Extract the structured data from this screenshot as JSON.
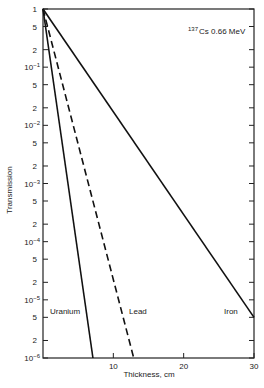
{
  "chart_data": {
    "type": "line",
    "title": "",
    "annotation": {
      "isotope_mass": "137",
      "text": "Cs 0.66 MeV"
    },
    "xlabel": "Thickness, cm",
    "ylabel": "Transmission",
    "xlim": [
      0,
      30
    ],
    "ylim": [
      1e-06,
      1
    ],
    "yscale": "log",
    "x_ticks": [
      {
        "value": 10,
        "label": "10"
      },
      {
        "value": 20,
        "label": "20"
      },
      {
        "value": 30,
        "label": "30"
      }
    ],
    "y_ticks": [
      {
        "value": 1,
        "label": "1",
        "exp": ""
      },
      {
        "value": 0.5,
        "label": "5",
        "exp": ""
      },
      {
        "value": 0.2,
        "label": "2",
        "exp": ""
      },
      {
        "value": 0.1,
        "label": "10",
        "exp": "−1"
      },
      {
        "value": 0.05,
        "label": "5",
        "exp": ""
      },
      {
        "value": 0.02,
        "label": "2",
        "exp": ""
      },
      {
        "value": 0.01,
        "label": "10",
        "exp": "−2"
      },
      {
        "value": 0.005,
        "label": "5",
        "exp": ""
      },
      {
        "value": 0.002,
        "label": "2",
        "exp": ""
      },
      {
        "value": 0.001,
        "label": "10",
        "exp": "−3"
      },
      {
        "value": 0.0005,
        "label": "5",
        "exp": ""
      },
      {
        "value": 0.0002,
        "label": "2",
        "exp": ""
      },
      {
        "value": 0.0001,
        "label": "10",
        "exp": "−4"
      },
      {
        "value": 5e-05,
        "label": "5",
        "exp": ""
      },
      {
        "value": 2e-05,
        "label": "2",
        "exp": ""
      },
      {
        "value": 1e-05,
        "label": "10",
        "exp": "−5"
      },
      {
        "value": 5e-06,
        "label": "5",
        "exp": ""
      },
      {
        "value": 2e-06,
        "label": "2",
        "exp": ""
      },
      {
        "value": 1e-06,
        "label": "10",
        "exp": "−6"
      }
    ],
    "grid": false,
    "frame": "box",
    "series": [
      {
        "name": "Uranium",
        "style": "solid",
        "x": [
          0,
          7.1
        ],
        "y": [
          1,
          1e-06
        ]
      },
      {
        "name": "Lead",
        "style": "dashed",
        "x": [
          0,
          12.9
        ],
        "y": [
          1,
          1e-06
        ]
      },
      {
        "name": "Iron",
        "style": "solid",
        "x": [
          0,
          30
        ],
        "y": [
          1,
          5e-06
        ]
      }
    ]
  }
}
